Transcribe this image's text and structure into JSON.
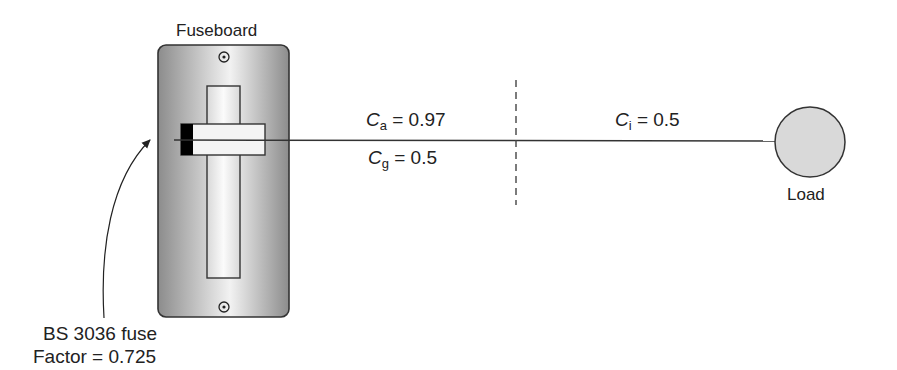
{
  "diagram": {
    "fuseboard": {
      "title": "Fuseboard",
      "fuse_label": "BS 3036 fuse",
      "fuse_factor": "Factor = 0.725"
    },
    "cable": {
      "segment1": {
        "ca_symbol": "C",
        "ca_subscript": "a",
        "ca_value": " = 0.97",
        "cg_symbol": "C",
        "cg_subscript": "g",
        "cg_value": " = 0.5"
      },
      "segment2": {
        "ci_symbol": "C",
        "ci_subscript": "i",
        "ci_value": " = 0.5"
      }
    },
    "load": {
      "label": "Load"
    },
    "colors": {
      "line": "#333333",
      "fuseboard_dark": "#8a8a8a",
      "fuseboard_light": "#efefef",
      "load_fill": "#d9d9d9",
      "fuse_block": "#000000"
    }
  }
}
